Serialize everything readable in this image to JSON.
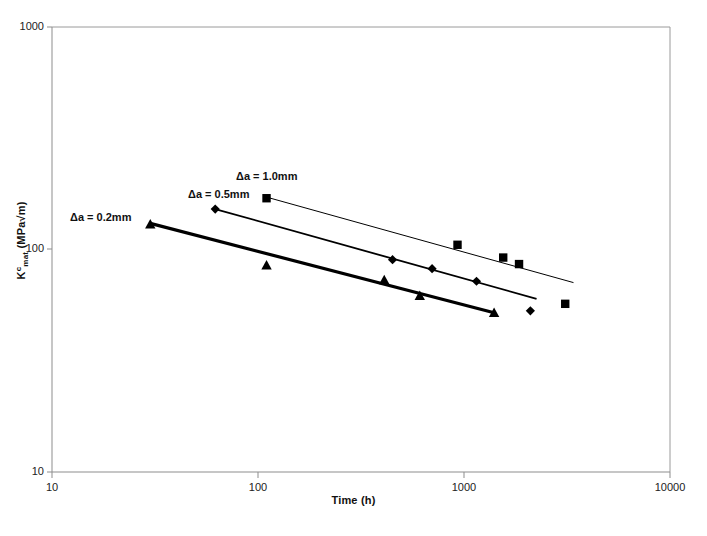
{
  "chart_data": {
    "type": "scatter",
    "title": "",
    "xlabel": "Time (h)",
    "ylabel": "K<c>mat (MPa√m)",
    "ylabel_main": "K",
    "ylabel_sup": "c",
    "ylabel_sub": "mat",
    "ylabel_unit": " (MPa√m)",
    "xscale": "log",
    "yscale": "log",
    "xlim": [
      10,
      10000
    ],
    "ylim": [
      10,
      1000
    ],
    "xticks": [
      "10",
      "100",
      "1000",
      "10000"
    ],
    "yticks": [
      "10",
      "100",
      "1000"
    ],
    "grid": false,
    "legend": "none",
    "marker_color": "#000000",
    "frame_color": "#999999",
    "annotations": [
      {
        "text": "Δa = 0.2mm",
        "x_px": 70,
        "y_px": 211
      },
      {
        "text": "Δa = 0.5mm",
        "x_px": 188,
        "y_px": 188
      },
      {
        "text": "Δa = 1.0mm",
        "x_px": 236,
        "y_px": 170
      }
    ],
    "series": [
      {
        "name": "Δa = 0.2mm",
        "marker": "triangle",
        "line_width_px": 3.2,
        "points": [
          {
            "x": 30,
            "y": 130
          },
          {
            "x": 110,
            "y": 85
          },
          {
            "x": 410,
            "y": 73
          },
          {
            "x": 610,
            "y": 62
          },
          {
            "x": 1400,
            "y": 52
          }
        ],
        "trendline": [
          {
            "x": 30,
            "y": 131
          },
          {
            "x": 1400,
            "y": 52
          }
        ]
      },
      {
        "name": "Δa = 0.5mm",
        "marker": "diamond",
        "line_width_px": 1.8,
        "points": [
          {
            "x": 62,
            "y": 152
          },
          {
            "x": 450,
            "y": 90
          },
          {
            "x": 700,
            "y": 82
          },
          {
            "x": 1150,
            "y": 72
          },
          {
            "x": 2100,
            "y": 53
          }
        ],
        "trendline": [
          {
            "x": 62,
            "y": 152
          },
          {
            "x": 2250,
            "y": 60
          }
        ]
      },
      {
        "name": "Δa = 1.0mm",
        "marker": "square",
        "line_width_px": 1.0,
        "points": [
          {
            "x": 110,
            "y": 170
          },
          {
            "x": 930,
            "y": 105
          },
          {
            "x": 1550,
            "y": 92
          },
          {
            "x": 1850,
            "y": 86
          },
          {
            "x": 3100,
            "y": 57
          }
        ],
        "trendline": [
          {
            "x": 110,
            "y": 172
          },
          {
            "x": 3400,
            "y": 71
          }
        ]
      }
    ]
  }
}
